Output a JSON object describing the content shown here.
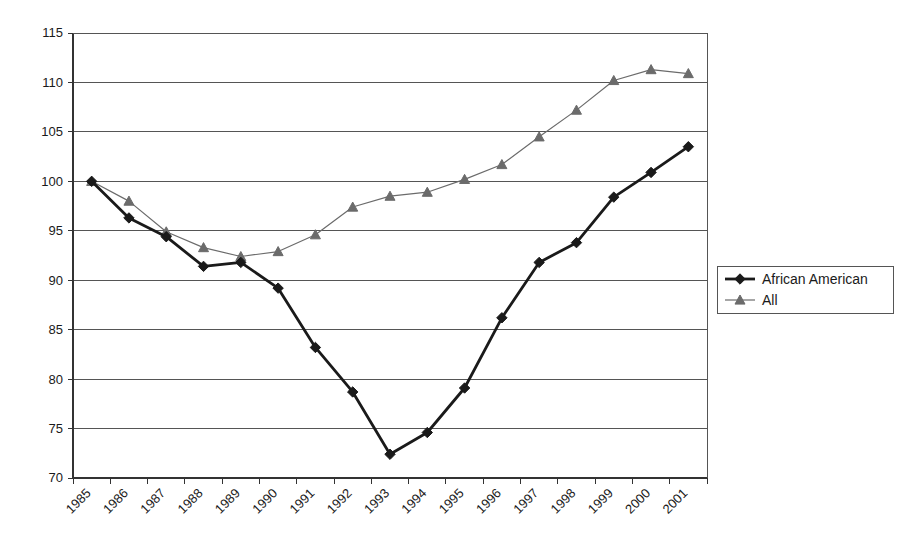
{
  "chart_data": {
    "type": "line",
    "title": "",
    "subtitle": "",
    "xlabel": "",
    "ylabel": "",
    "grid": "horizontal",
    "legend_position": "right",
    "ylim": [
      70,
      115
    ],
    "ytick_step": 5,
    "ytick_labels": [
      "115",
      "110",
      "105",
      "100",
      "95",
      "90",
      "85",
      "80",
      "75",
      "70"
    ],
    "categories": [
      "1985",
      "1986",
      "1987",
      "1988",
      "1989",
      "1990",
      "1991",
      "1992",
      "1993",
      "1994",
      "1995",
      "1996",
      "1997",
      "1998",
      "1999",
      "2000",
      "2001"
    ],
    "series": [
      {
        "name": "African American",
        "color": "#1a1a1a",
        "marker": "diamond",
        "line_width": 2.8,
        "values": [
          100.0,
          96.3,
          94.4,
          91.4,
          91.8,
          89.2,
          83.2,
          78.7,
          72.4,
          74.6,
          79.1,
          86.2,
          91.8,
          93.8,
          98.4,
          100.9,
          103.5
        ]
      },
      {
        "name": "All",
        "color": "#6b6b6b",
        "marker": "triangle",
        "line_width": 1.2,
        "values": [
          100.0,
          98.0,
          94.9,
          93.3,
          92.4,
          92.9,
          94.6,
          97.4,
          98.5,
          98.9,
          100.2,
          101.7,
          104.5,
          107.2,
          110.2,
          111.3,
          110.9
        ]
      }
    ]
  },
  "legend": {
    "entries": [
      {
        "label": "African American"
      },
      {
        "label": "All"
      }
    ]
  }
}
